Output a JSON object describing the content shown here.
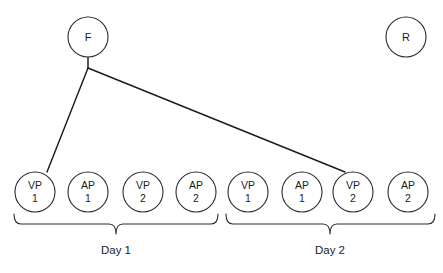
{
  "diagram": {
    "colors": {
      "background": "#ffffff",
      "stroke": "#2b2b2b",
      "edge": "#1c1c1c",
      "text": "#1c1c1c"
    },
    "top_nodes": [
      {
        "id": "F",
        "label": "F",
        "cx": 88,
        "cy": 37,
        "r": 20
      },
      {
        "id": "R",
        "label": "R",
        "cx": 406,
        "cy": 37,
        "r": 20
      }
    ],
    "bottom_nodes": [
      {
        "id": "d1-vp1",
        "line1": "VP",
        "line2": "1",
        "cx": 35,
        "cy": 192,
        "r": 20,
        "group": "Day 1"
      },
      {
        "id": "d1-ap1",
        "line1": "AP",
        "line2": "1",
        "cx": 88,
        "cy": 192,
        "r": 20,
        "group": "Day 1"
      },
      {
        "id": "d1-vp2",
        "line1": "VP",
        "line2": "2",
        "cx": 143,
        "cy": 192,
        "r": 20,
        "group": "Day 1"
      },
      {
        "id": "d1-ap2",
        "line1": "AP",
        "line2": "2",
        "cx": 196,
        "cy": 192,
        "r": 20,
        "group": "Day 1"
      },
      {
        "id": "d2-vp1",
        "line1": "VP",
        "line2": "1",
        "cx": 248,
        "cy": 192,
        "r": 20,
        "group": "Day 2"
      },
      {
        "id": "d2-ap1",
        "line1": "AP",
        "line2": "1",
        "cx": 302,
        "cy": 192,
        "r": 20,
        "group": "Day 2"
      },
      {
        "id": "d2-vp2",
        "line1": "VP",
        "line2": "2",
        "cx": 353,
        "cy": 192,
        "r": 20,
        "group": "Day 2"
      },
      {
        "id": "d2-ap2",
        "line1": "AP",
        "line2": "2",
        "cx": 408,
        "cy": 192,
        "r": 20,
        "group": "Day 2"
      }
    ],
    "edges": [
      {
        "id": "f-stem",
        "from": "F",
        "to": "junction",
        "path": "M 88 57 L 88 68"
      },
      {
        "id": "f-to-d1-vp1",
        "from": "junction",
        "to": "d1-vp1",
        "path": "M 88 68 L 47 172"
      },
      {
        "id": "f-to-d2-vp2",
        "from": "junction",
        "to": "d2-vp2",
        "path": "M 88 68 L 345 172"
      }
    ],
    "groups": [
      {
        "id": "day-1",
        "label": "Day 1",
        "label_x": 116,
        "label_y": 254,
        "brace_path": "M 14 214 Q 14 224 21 224 L 109 224 Q 116 224 116 234 Q 116 224 123 224 L 211 224 Q 218 224 218 214"
      },
      {
        "id": "day-2",
        "label": "Day 2",
        "label_x": 330,
        "label_y": 254,
        "brace_path": "M 226 214 Q 226 224 233 224 L 323 224 Q 330 224 330 234 Q 330 224 337 224 L 428 224 Q 435 224 435 214"
      }
    ]
  }
}
